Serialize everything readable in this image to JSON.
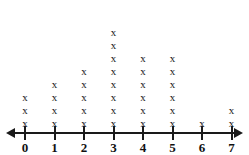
{
  "chart_data": {
    "type": "dotplot",
    "title": "",
    "subtitle": "",
    "xlabel": "",
    "ylabel": "",
    "categories": [
      "0",
      "1",
      "2",
      "3",
      "4",
      "5",
      "6",
      "7",
      "8"
    ],
    "values": [
      3,
      4,
      5,
      8,
      6,
      6,
      1,
      2,
      1
    ],
    "x": [
      0,
      1,
      2,
      3,
      4,
      5,
      6,
      7,
      8
    ],
    "xlim": [
      0,
      8
    ],
    "ylim": [
      0,
      8
    ],
    "total_count": 36,
    "mark_glyph": "x",
    "grid": false,
    "legend": null,
    "axis": {
      "arrow_left": true,
      "arrow_right": true,
      "tick_labels": [
        "0",
        "1",
        "2",
        "3",
        "4",
        "5",
        "6",
        "7",
        "8"
      ]
    },
    "colors": {
      "mark": "#1a1a1a",
      "axis": "#1a1a1a",
      "label": "#111111",
      "background": "#ffffff"
    }
  }
}
